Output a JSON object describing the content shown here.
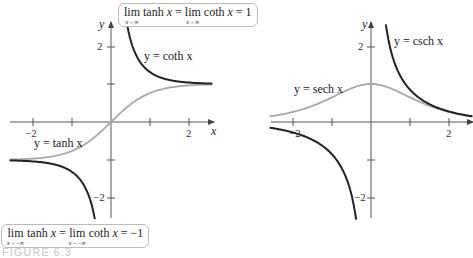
{
  "chart_data": [
    {
      "type": "line",
      "title": "",
      "xlabel": "x",
      "ylabel": "y",
      "xlim": [
        -2.5,
        2.5
      ],
      "ylim": [
        -2.5,
        2.5
      ],
      "x_ticks": [
        -2,
        -1,
        0,
        1,
        2
      ],
      "x_tick_labels": [
        "−2",
        "",
        "",
        "",
        "2"
      ],
      "y_ticks": [
        -2,
        -1,
        1,
        2
      ],
      "y_tick_labels": [
        "−2",
        "",
        "",
        "2"
      ],
      "grid": false,
      "series": [
        {
          "name": "y = tanh x",
          "function": "tanh",
          "color": "#a8a8a8",
          "x_range": [
            -2.6,
            2.6
          ]
        },
        {
          "name": "y = coth x (x>0)",
          "function": "coth",
          "color": "#222222",
          "x_range": [
            0.38,
            2.6
          ]
        },
        {
          "name": "y = coth x (x<0)",
          "function": "coth",
          "color": "#222222",
          "x_range": [
            -2.6,
            -0.38
          ]
        }
      ],
      "annotations": [
        {
          "text": "lim(x→∞) tanh x = lim(x→∞) coth x = 1"
        },
        {
          "text": "lim(x→−∞) tanh x = lim(x→−∞) coth x = −1"
        }
      ]
    },
    {
      "type": "line",
      "title": "",
      "xlabel": "x",
      "ylabel": "y",
      "xlim": [
        -2.5,
        2.6
      ],
      "ylim": [
        -2.5,
        2.5
      ],
      "x_ticks": [
        -2,
        -1,
        0,
        1,
        2
      ],
      "x_tick_labels": [
        "−2",
        "",
        "",
        "",
        "2"
      ],
      "y_ticks": [
        -2,
        -1,
        1,
        2
      ],
      "y_tick_labels": [
        "−2",
        "",
        "",
        "2"
      ],
      "grid": false,
      "series": [
        {
          "name": "y = sech x",
          "function": "sech",
          "color": "#a8a8a8",
          "x_range": [
            -2.6,
            2.6
          ]
        },
        {
          "name": "y = csch x (x>0)",
          "function": "csch",
          "color": "#222222",
          "x_range": [
            0.38,
            2.6
          ]
        },
        {
          "name": "y = csch x (x<0)",
          "function": "csch",
          "color": "#222222",
          "x_range": [
            -2.6,
            -0.38
          ]
        }
      ]
    }
  ],
  "left_plot": {
    "origin_px": [
      111,
      122
    ],
    "unit_px": [
      39,
      38
    ],
    "axis_x_label": "x",
    "axis_y_label": "y",
    "tick_label_neg2": "−2",
    "tick_label_2": "2",
    "ytick_label_2": "2",
    "ytick_label_neg2": "−2",
    "curve_label_coth": "y = coth x",
    "curve_label_tanh": "y = tanh x",
    "limit_top": {
      "lim": "lim",
      "sub": "x→∞",
      "f1": "tanh",
      "eq": "=",
      "f2": "coth",
      "rhs": "= 1"
    },
    "limit_bottom": {
      "lim": "lim",
      "sub": "x→−∞",
      "f1": "tanh",
      "eq": "=",
      "f2": "coth",
      "rhs": "= −1"
    }
  },
  "right_plot": {
    "origin_px": [
      371,
      122
    ],
    "unit_px": [
      39,
      38
    ],
    "axis_y_label": "y",
    "tick_label_neg2": "−2",
    "tick_label_2": "2",
    "ytick_label_2": "2",
    "ytick_label_neg2": "−2",
    "curve_label_csch": "y = csch x",
    "curve_label_sech": "y = sech x"
  },
  "caption": "FIGURE 6.3",
  "colors": {
    "axis": "#555555",
    "dark_curve": "#222222",
    "light_curve": "#a8a8a8"
  }
}
